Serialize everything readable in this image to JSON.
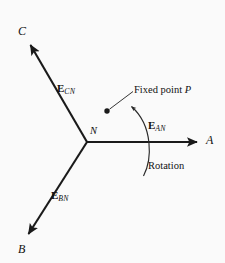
{
  "figure": {
    "type": "phasor-diagram",
    "background_color": "#fafafa",
    "stroke_color": "#1a1a1a",
    "width": 225,
    "height": 263
  },
  "center_node": {
    "label": "N",
    "x": 87,
    "y": 142
  },
  "axes": [
    {
      "name": "phase-a",
      "terminal_label": "A",
      "phasor_label_e": "E",
      "phasor_label_sub": "AN",
      "angle_deg": 0,
      "tip": {
        "x": 200,
        "y": 142
      }
    },
    {
      "name": "phase-b",
      "terminal_label": "B",
      "phasor_label_e": "E",
      "phasor_label_sub": "BN",
      "angle_deg": -120,
      "tip": {
        "x": 26,
        "y": 237
      }
    },
    {
      "name": "phase-c",
      "terminal_label": "C",
      "phasor_label_e": "E",
      "phasor_label_sub": "CN",
      "angle_deg": 120,
      "tip": {
        "x": 28,
        "y": 42
      }
    }
  ],
  "annotations": {
    "fixed_point": {
      "text_prefix": "Fixed point ",
      "text_italic": "P",
      "dot": {
        "x": 107,
        "y": 111
      }
    },
    "rotation": {
      "text": "Rotation",
      "direction": "counterclockwise"
    }
  }
}
